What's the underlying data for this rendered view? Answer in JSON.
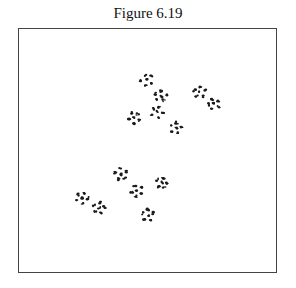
{
  "figure": {
    "caption": "Figure 6.19",
    "frame": {
      "x": 18,
      "y": 28,
      "width": 259,
      "height": 245,
      "border_color": "#444444"
    },
    "ink_color": "#1a1a1a"
  },
  "clusters": [
    {
      "group": "upper",
      "cx": 147,
      "cy": 80
    },
    {
      "group": "upper",
      "cx": 161,
      "cy": 96
    },
    {
      "group": "upper",
      "cx": 134,
      "cy": 118
    },
    {
      "group": "upper",
      "cx": 157,
      "cy": 112
    },
    {
      "group": "upper",
      "cx": 176,
      "cy": 128
    },
    {
      "group": "upper",
      "cx": 200,
      "cy": 92
    },
    {
      "group": "upper",
      "cx": 214,
      "cy": 104
    },
    {
      "group": "lower",
      "cx": 82,
      "cy": 198
    },
    {
      "group": "lower",
      "cx": 99,
      "cy": 208
    },
    {
      "group": "lower",
      "cx": 121,
      "cy": 174
    },
    {
      "group": "lower",
      "cx": 137,
      "cy": 191
    },
    {
      "group": "lower",
      "cx": 162,
      "cy": 183
    },
    {
      "group": "lower",
      "cx": 148,
      "cy": 215
    }
  ]
}
